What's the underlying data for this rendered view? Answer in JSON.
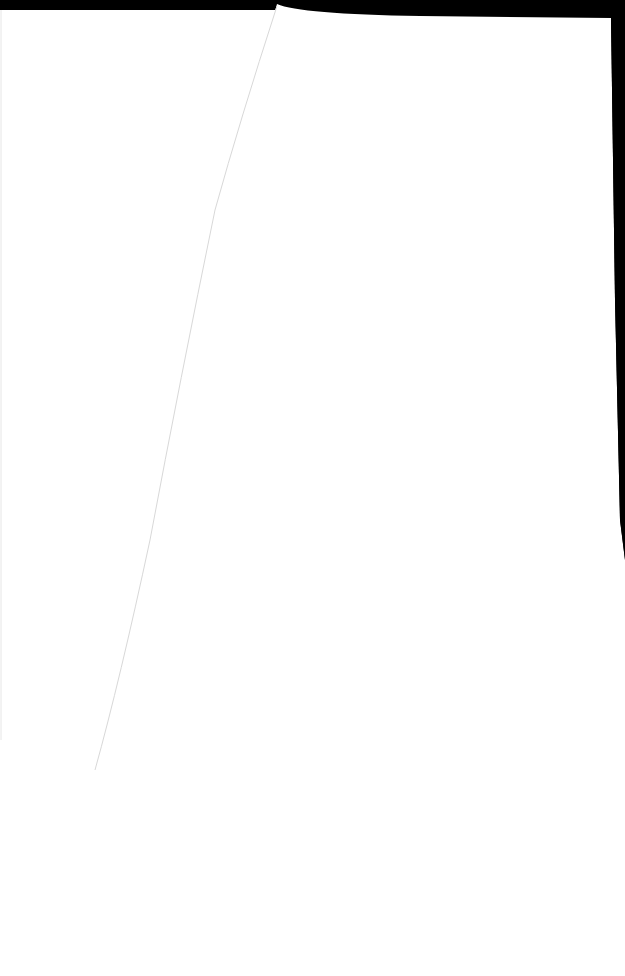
{
  "scene": {
    "description": "Blank white paper sheets on a black background",
    "colors": {
      "background": "#000000",
      "paper": "#ffffff",
      "paper_edge_line": "#d8d8d8"
    }
  }
}
